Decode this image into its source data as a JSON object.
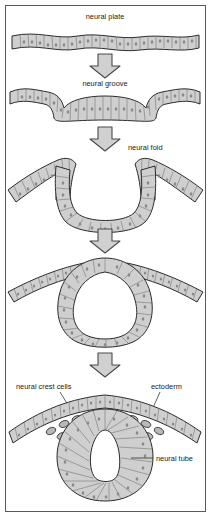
{
  "figure": {
    "background_color": "#ffffff",
    "frame_color": "#5a5a5a",
    "tissue_fill": "#cfcfcf",
    "tissue_stroke": "#2b2b2b",
    "cell_line_color": "#6e6e6e",
    "nucleus_color": "#8a8a8a",
    "arrow_fill": "#d0d0d0",
    "arrow_stroke": "#4a4a4a",
    "label_color": "#1a1a1a",
    "lumen_fill": "#ffffff"
  },
  "labels": {
    "neural_plate": "neural plate",
    "neural_groove": "neural groove",
    "neural_fold": "neural fold",
    "neural_crest_cells": "neural crest cells",
    "ectoderm": "ectoderm",
    "neural_tube": "neural tube"
  },
  "stages": [
    {
      "index": 1,
      "name": "neural-plate-stage",
      "label": "neural plate"
    },
    {
      "index": 2,
      "name": "neural-groove-stage",
      "label": "neural groove"
    },
    {
      "index": 3,
      "name": "neural-fold-stage",
      "label": "neural fold"
    },
    {
      "index": 4,
      "name": "closing-fold-stage",
      "label": ""
    },
    {
      "index": 5,
      "name": "neural-tube-stage",
      "label": "neural tube"
    }
  ],
  "arrows": [
    {
      "index": 1,
      "direction": "down"
    },
    {
      "index": 2,
      "direction": "down"
    },
    {
      "index": 3,
      "direction": "down"
    },
    {
      "index": 4,
      "direction": "down"
    }
  ]
}
